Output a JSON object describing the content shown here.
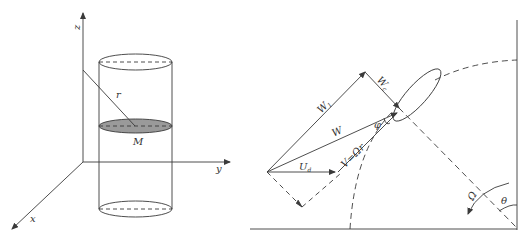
{
  "left_figure": {
    "axes": {
      "z_label": "z",
      "y_label": "y",
      "x_label": "x"
    },
    "radius_label": "r",
    "section_label": "M",
    "colors": {
      "stroke": "#3a3a3a",
      "section_fill": "#9a9a9a"
    }
  },
  "right_figure": {
    "vectors": {
      "w1_label": "W",
      "w1_sub": "1",
      "wc_label": "W",
      "wc_sub": "c",
      "w_label": "W",
      "ud_label": "U",
      "ud_sub": "d",
      "v_label": "V=Ωr"
    },
    "angle_phi_label": "φ",
    "rotation_label": "Ω",
    "angle_theta_label": "θ",
    "colors": {
      "stroke": "#3a3a3a"
    }
  }
}
